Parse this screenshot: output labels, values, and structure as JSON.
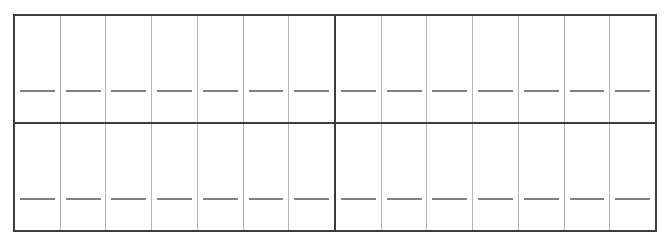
{
  "document": {
    "title": "Blank Grid Worksheet",
    "description": "Two-row grid form with fourteen empty cells, each containing a blank writing line",
    "rows": 2,
    "blocks_per_row": 2,
    "cells_per_block": 7,
    "total_cells": 28,
    "cell_value": "",
    "writing_line_glyph": "—"
  },
  "colors": {
    "background": "#ffffff",
    "outer_border": "#3c3c3c",
    "block_divider": "#3c3c3c",
    "cell_divider": "#b4b4b4",
    "writing_line": "#808080"
  },
  "grid": {
    "rows": [
      {
        "row_label": "row-1",
        "blocks": [
          {
            "block_label": "row-1-block-left",
            "cells": [
              {
                "cell_label": "r1-c1",
                "value": ""
              },
              {
                "cell_label": "r1-c2",
                "value": ""
              },
              {
                "cell_label": "r1-c3",
                "value": ""
              },
              {
                "cell_label": "r1-c4",
                "value": ""
              },
              {
                "cell_label": "r1-c5",
                "value": ""
              },
              {
                "cell_label": "r1-c6",
                "value": ""
              },
              {
                "cell_label": "r1-c7",
                "value": ""
              }
            ]
          },
          {
            "block_label": "row-1-block-right",
            "cells": [
              {
                "cell_label": "r1-c8",
                "value": ""
              },
              {
                "cell_label": "r1-c9",
                "value": ""
              },
              {
                "cell_label": "r1-c10",
                "value": ""
              },
              {
                "cell_label": "r1-c11",
                "value": ""
              },
              {
                "cell_label": "r1-c12",
                "value": ""
              },
              {
                "cell_label": "r1-c13",
                "value": ""
              },
              {
                "cell_label": "r1-c14",
                "value": ""
              }
            ]
          }
        ]
      },
      {
        "row_label": "row-2",
        "blocks": [
          {
            "block_label": "row-2-block-left",
            "cells": [
              {
                "cell_label": "r2-c1",
                "value": ""
              },
              {
                "cell_label": "r2-c2",
                "value": ""
              },
              {
                "cell_label": "r2-c3",
                "value": ""
              },
              {
                "cell_label": "r2-c4",
                "value": ""
              },
              {
                "cell_label": "r2-c5",
                "value": ""
              },
              {
                "cell_label": "r2-c6",
                "value": ""
              },
              {
                "cell_label": "r2-c7",
                "value": ""
              }
            ]
          },
          {
            "block_label": "row-2-block-right",
            "cells": [
              {
                "cell_label": "r2-c8",
                "value": ""
              },
              {
                "cell_label": "r2-c9",
                "value": ""
              },
              {
                "cell_label": "r2-c10",
                "value": ""
              },
              {
                "cell_label": "r2-c11",
                "value": ""
              },
              {
                "cell_label": "r2-c12",
                "value": ""
              },
              {
                "cell_label": "r2-c13",
                "value": ""
              },
              {
                "cell_label": "r2-c14",
                "value": ""
              }
            ]
          }
        ]
      }
    ]
  }
}
